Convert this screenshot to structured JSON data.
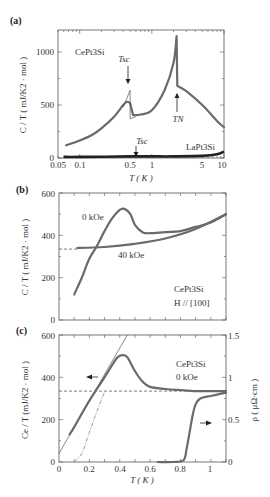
{
  "panels": {
    "a": {
      "label": "(a)",
      "sample": "CePt3Si",
      "sample_ref": "LaPt3Si",
      "tsc_label": "Tsc",
      "tn_label": "TN",
      "ylabel": "C / T ( mJ/K2 · mol )",
      "xlabel": "T ( K )",
      "yticks": [
        "0",
        "500",
        "1000"
      ],
      "xticks": [
        "0.05",
        "0.1",
        "0.5",
        "1",
        "5",
        "10"
      ]
    },
    "b": {
      "label": "(b)",
      "sample": "CePt3Si",
      "field_dir": "H // [100]",
      "series0": "0 kOe",
      "series1": "40 kOe",
      "ylabel": "C / T ( mJ/K2 · mol )",
      "yticks": [
        "0",
        "200",
        "400",
        "600"
      ]
    },
    "c": {
      "label": "(c)",
      "sample": "CePt3Si",
      "field": "0 kOe",
      "ylabel": "Ce / T (mJ/K2 · mol )",
      "y2label": "ρ ( μΩ·cm )",
      "xlabel": "T ( K )",
      "yticks": [
        "0",
        "200",
        "400",
        "600"
      ],
      "y2ticks": [
        "0",
        "0.5",
        "1",
        "1.5"
      ],
      "xticks": [
        "0",
        "0.2",
        "0.4",
        "0.6",
        "0.8",
        "1"
      ]
    }
  },
  "chart_data": [
    {
      "type": "line",
      "title": "(a) C/T vs T (log scale)",
      "xlabel": "T (K)",
      "ylabel": "C / T (mJ/K^2 mol)",
      "xscale": "log",
      "xlim": [
        0.05,
        10
      ],
      "ylim": [
        0,
        1200
      ],
      "annotations": [
        "Tsc ≈ 0.5 K (CePt3Si)",
        "TN ≈ 2.2 K",
        "Tsc ≈ 0.6 K (LaPt3Si)"
      ],
      "series": [
        {
          "name": "CePt3Si",
          "x": [
            0.065,
            0.1,
            0.15,
            0.2,
            0.3,
            0.4,
            0.45,
            0.5,
            0.55,
            0.7,
            1.0,
            1.5,
            2.0,
            2.2,
            2.25,
            3.0,
            5.0,
            8.0,
            10.0
          ],
          "y": [
            120,
            165,
            220,
            280,
            390,
            500,
            530,
            520,
            405,
            410,
            450,
            640,
            900,
            1150,
            680,
            630,
            500,
            350,
            290
          ]
        },
        {
          "name": "LaPt3Si",
          "x": [
            0.06,
            0.1,
            0.5,
            1,
            2,
            5,
            8,
            10
          ],
          "y": [
            10,
            10,
            15,
            15,
            15,
            20,
            35,
            60
          ]
        }
      ]
    },
    {
      "type": "line",
      "title": "(b) C/T vs T, CePt3Si H // [100]",
      "xlabel": "T (K)",
      "ylabel": "C / T (mJ/K^2 mol)",
      "xlim": [
        0,
        1.1
      ],
      "ylim": [
        0,
        600
      ],
      "series": [
        {
          "name": "0 kOe",
          "x": [
            0.1,
            0.15,
            0.2,
            0.25,
            0.3,
            0.35,
            0.4,
            0.43,
            0.47,
            0.5,
            0.55,
            0.6,
            0.7,
            0.8,
            0.9,
            1.0,
            1.1
          ],
          "y": [
            120,
            200,
            290,
            350,
            420,
            480,
            520,
            525,
            500,
            450,
            415,
            410,
            415,
            420,
            440,
            460,
            500
          ]
        },
        {
          "name": "40 kOe",
          "x": [
            0.12,
            0.3,
            0.5,
            0.7,
            0.9,
            1.1
          ],
          "y": [
            340,
            345,
            360,
            385,
            430,
            500
          ]
        }
      ],
      "reference_line": {
        "style": "dashed",
        "y": 335,
        "x": [
          0,
          0.13
        ]
      }
    },
    {
      "type": "line",
      "title": "(c) Ce/T and resistivity vs T, CePt3Si 0 kOe",
      "xlabel": "T (K)",
      "ylabel": "Ce / T (mJ/K^2 mol)",
      "y2label": "ρ (μΩ·cm)",
      "xlim": [
        0,
        1.1
      ],
      "ylim": [
        0,
        600
      ],
      "y2lim": [
        0,
        1.5
      ],
      "series": [
        {
          "name": "Ce/T",
          "x": [
            0.07,
            0.1,
            0.2,
            0.3,
            0.38,
            0.42,
            0.45,
            0.5,
            0.55,
            0.6,
            0.7,
            0.8,
            0.9,
            1.0,
            1.1
          ],
          "y": [
            130,
            165,
            290,
            400,
            490,
            505,
            495,
            430,
            380,
            355,
            345,
            340,
            335,
            335,
            335
          ]
        },
        {
          "name": "linear fit",
          "x": [
            0,
            0.45
          ],
          "y": [
            40,
            600
          ]
        },
        {
          "name": "dash-dot fit",
          "x": [
            0.1,
            0.15,
            0.2,
            0.25,
            0.3
          ],
          "y": [
            0,
            40,
            140,
            240,
            330
          ]
        },
        {
          "name": "ρ",
          "axis": "right",
          "x": [
            0.65,
            0.75,
            0.82,
            0.84,
            0.86,
            0.88,
            0.9,
            0.93,
            1.0,
            1.1
          ],
          "y": [
            0,
            0,
            0.02,
            0.15,
            0.35,
            0.55,
            0.68,
            0.75,
            0.78,
            0.82
          ]
        }
      ],
      "reference_line": {
        "style": "dashed",
        "y": 335,
        "x": [
          0,
          1.1
        ]
      }
    }
  ]
}
